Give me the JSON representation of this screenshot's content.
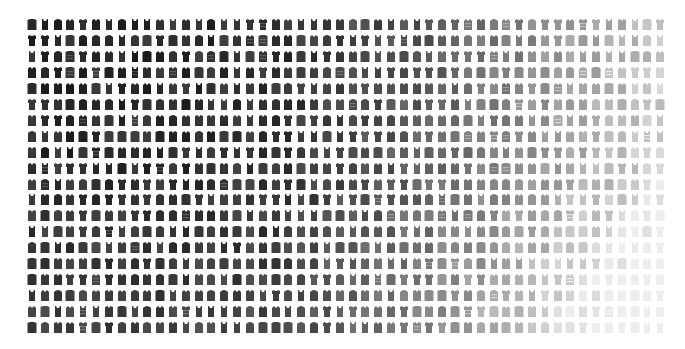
{
  "image": {
    "description": "Grid of garment (shirt / top) thumbnails arranged by tone, dark to light",
    "background": "#ffffff"
  },
  "grid": {
    "columns": 50,
    "rows": 20,
    "origin_x": 27,
    "origin_y": 18,
    "pitch_x": 12.82,
    "pitch_y": 15.95,
    "cell_w": 10,
    "cell_h": 13
  },
  "tone": {
    "column_gray": [
      40,
      40,
      42,
      41,
      43,
      42,
      41,
      44,
      43,
      42,
      43,
      44,
      42,
      45,
      44,
      46,
      45,
      47,
      46,
      48,
      50,
      55,
      58,
      62,
      66,
      70,
      72,
      75,
      78,
      82,
      86,
      90,
      95,
      100,
      106,
      112,
      118,
      124,
      130,
      136,
      142,
      148,
      154,
      160,
      166,
      172,
      178,
      184,
      190,
      196
    ],
    "row_gray_boost": [
      0,
      0,
      2,
      4,
      5,
      6,
      8,
      10,
      12,
      14,
      18,
      24,
      30,
      36,
      42,
      48,
      54,
      58,
      62,
      64
    ],
    "row_boost_column_weight_start": 20,
    "max_gray": 238
  },
  "shapes": [
    "tee",
    "shirt-collar",
    "tank",
    "sweater",
    "polo",
    "hoodie"
  ],
  "pattern_seed": 7
}
